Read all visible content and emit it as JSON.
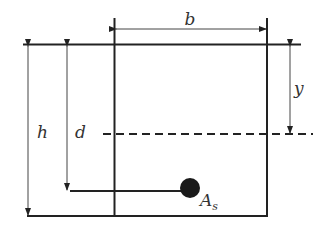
{
  "diagram": {
    "labels": {
      "width": "b",
      "height": "h",
      "effective_depth": "d",
      "neutral_axis_depth": "y",
      "steel_area_main": "A",
      "steel_area_sub": "s"
    },
    "colors": {
      "stroke": "#222222",
      "thin_stroke": "#555555",
      "rebar_fill": "#1a1a1a",
      "text": "#333333"
    }
  }
}
